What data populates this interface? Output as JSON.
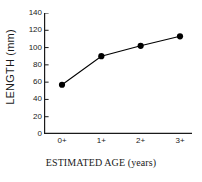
{
  "chart_data": {
    "type": "line",
    "title": "",
    "xlabel": "ESTIMATED AGE (years)",
    "ylabel": "LENGTH (mm)",
    "categories": [
      "0+",
      "1+",
      "2+",
      "3+"
    ],
    "values": [
      57,
      90,
      102,
      113
    ],
    "ylim": [
      0,
      140
    ],
    "yticks": [
      0,
      20,
      40,
      60,
      80,
      100,
      120,
      140
    ],
    "ytick_labels": [
      "0",
      "20",
      "40",
      "60",
      "80",
      "100",
      "120",
      "140"
    ],
    "grid": false,
    "legend": null,
    "marker": "filled-circle",
    "line_color": "#000000",
    "marker_color": "#000000",
    "axis_color": "#1a1a1a",
    "background": "#ffffff",
    "spines": [
      "left",
      "bottom"
    ]
  }
}
